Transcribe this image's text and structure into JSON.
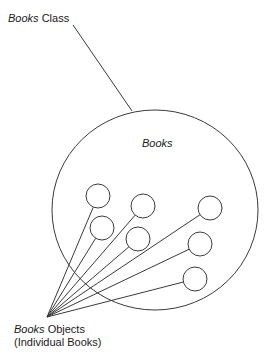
{
  "diagram": {
    "class_label": {
      "italic": "Books",
      "normal": " Class"
    },
    "set_label": "Books",
    "objects_label": {
      "line1_italic": "Books",
      "line1_normal": " Objects",
      "line2": "(Individual Books)"
    },
    "stroke_color": "#3a3a3a",
    "class_circle": {
      "cx": 155,
      "cy": 210,
      "rx": 103,
      "ry": 100
    },
    "class_pointer": {
      "x1": 73,
      "y1": 25,
      "x2": 132,
      "y2": 111
    },
    "convergence_point": {
      "x": 47,
      "y": 317
    },
    "object_circles": [
      {
        "cx": 98,
        "cy": 196,
        "r": 12
      },
      {
        "cx": 102,
        "cy": 228,
        "r": 12
      },
      {
        "cx": 143,
        "cy": 206,
        "r": 12
      },
      {
        "cx": 138,
        "cy": 239,
        "r": 12
      },
      {
        "cx": 210,
        "cy": 208,
        "r": 12
      },
      {
        "cx": 200,
        "cy": 244,
        "r": 12
      },
      {
        "cx": 195,
        "cy": 279,
        "r": 12
      }
    ]
  }
}
